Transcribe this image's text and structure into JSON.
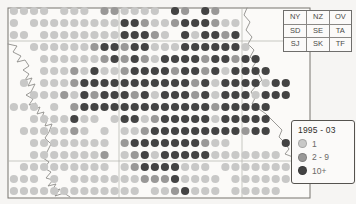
{
  "figure": {
    "type": "hectad dot distribution map",
    "region_squares_table": {
      "rows": [
        [
          "NY",
          "NZ",
          "OV"
        ],
        [
          "SD",
          "SE",
          "TA"
        ],
        [
          "SJ",
          "SK",
          "TF"
        ]
      ]
    },
    "legend": {
      "title": "1995 - 03",
      "items": [
        {
          "label": "1",
          "value": 1,
          "color": "#c8c8c7"
        },
        {
          "label": "2 - 9",
          "value": 2,
          "color": "#999897"
        },
        {
          "label": "10+",
          "value": 3,
          "color": "#434343"
        }
      ]
    }
  },
  "chart_data": {
    "type": "dot-distribution-map",
    "title": "1995 - 03",
    "legend_classes": [
      "1",
      "2 - 9",
      "10+"
    ],
    "cell_value_meaning": {
      "0": "no record",
      "1": "1",
      "2": "2 - 9",
      "3": "10+"
    },
    "map_frame": {
      "x": 8,
      "y": 8,
      "width": 302,
      "height": 190
    },
    "gridlines": {
      "vertical_x": [
        119,
        242
      ],
      "horizontal_y": [
        41,
        161
      ]
    },
    "grid": {
      "cols": 29,
      "rows": 16,
      "x0": 13.9,
      "dx": 10.07,
      "y0": 11,
      "dy": 12,
      "dot_radius": 4.1,
      "values": [
        [
          1,
          1,
          1,
          1,
          0,
          1,
          1,
          1,
          0,
          2,
          2,
          1,
          1,
          1,
          1,
          0,
          3,
          2,
          0,
          3,
          2,
          0,
          0,
          0,
          0,
          0,
          0,
          0,
          0
        ],
        [
          1,
          0,
          1,
          1,
          1,
          1,
          1,
          1,
          1,
          1,
          1,
          3,
          3,
          2,
          1,
          1,
          2,
          3,
          3,
          3,
          2,
          1,
          1,
          0,
          0,
          0,
          0,
          0,
          0
        ],
        [
          1,
          1,
          0,
          1,
          1,
          1,
          1,
          1,
          1,
          1,
          1,
          3,
          3,
          3,
          2,
          1,
          0,
          3,
          1,
          3,
          3,
          2,
          3,
          0,
          0,
          0,
          0,
          0,
          0
        ],
        [
          0,
          0,
          1,
          1,
          1,
          1,
          1,
          1,
          2,
          3,
          3,
          2,
          3,
          3,
          1,
          1,
          1,
          3,
          3,
          3,
          3,
          3,
          3,
          1,
          0,
          0,
          0,
          0,
          0
        ],
        [
          0,
          0,
          0,
          1,
          1,
          1,
          1,
          1,
          1,
          2,
          3,
          2,
          3,
          2,
          1,
          3,
          3,
          3,
          3,
          2,
          3,
          3,
          2,
          3,
          3,
          0,
          0,
          0,
          0
        ],
        [
          0,
          0,
          0,
          1,
          1,
          1,
          2,
          1,
          3,
          1,
          1,
          2,
          3,
          3,
          3,
          3,
          2,
          3,
          3,
          2,
          3,
          1,
          3,
          3,
          3,
          3,
          0,
          0,
          0
        ],
        [
          0,
          1,
          0,
          1,
          1,
          1,
          2,
          3,
          3,
          3,
          3,
          3,
          3,
          3,
          3,
          3,
          3,
          3,
          2,
          3,
          1,
          3,
          3,
          3,
          3,
          1,
          3,
          3,
          0
        ],
        [
          0,
          0,
          1,
          1,
          1,
          2,
          1,
          3,
          2,
          3,
          3,
          3,
          2,
          3,
          1,
          3,
          3,
          3,
          2,
          3,
          1,
          3,
          3,
          3,
          1,
          3,
          3,
          3,
          0
        ],
        [
          1,
          1,
          1,
          0,
          1,
          0,
          2,
          3,
          3,
          3,
          3,
          3,
          3,
          3,
          3,
          3,
          3,
          3,
          3,
          3,
          2,
          3,
          3,
          3,
          3,
          3,
          0,
          0,
          0
        ],
        [
          0,
          0,
          1,
          1,
          1,
          1,
          3,
          1,
          1,
          0,
          1,
          3,
          3,
          1,
          2,
          3,
          3,
          3,
          3,
          3,
          1,
          3,
          3,
          3,
          3,
          3,
          0,
          0,
          0
        ],
        [
          0,
          1,
          1,
          1,
          1,
          1,
          2,
          1,
          0,
          1,
          0,
          1,
          1,
          2,
          3,
          3,
          3,
          3,
          3,
          3,
          3,
          3,
          3,
          2,
          3,
          3,
          0,
          0,
          0
        ],
        [
          0,
          0,
          1,
          1,
          1,
          1,
          1,
          1,
          1,
          1,
          0,
          2,
          3,
          3,
          3,
          3,
          3,
          3,
          3,
          2,
          1,
          1,
          0,
          0,
          0,
          0,
          0,
          3,
          3
        ],
        [
          0,
          0,
          1,
          1,
          1,
          1,
          1,
          1,
          1,
          2,
          0,
          1,
          2,
          3,
          1,
          3,
          3,
          3,
          3,
          3,
          1,
          1,
          1,
          1,
          1,
          1,
          1,
          0,
          0
        ],
        [
          0,
          1,
          1,
          1,
          1,
          1,
          1,
          1,
          1,
          1,
          0,
          1,
          2,
          3,
          3,
          3,
          3,
          1,
          1,
          1,
          0,
          1,
          1,
          1,
          1,
          1,
          1,
          1,
          0
        ],
        [
          1,
          1,
          1,
          0,
          1,
          0,
          1,
          1,
          1,
          1,
          1,
          1,
          1,
          2,
          2,
          2,
          3,
          1,
          1,
          1,
          1,
          0,
          1,
          1,
          1,
          1,
          1,
          1,
          0
        ],
        [
          1,
          1,
          1,
          1,
          1,
          1,
          1,
          1,
          1,
          1,
          1,
          1,
          1,
          0,
          1,
          1,
          2,
          3,
          1,
          1,
          1,
          0,
          1,
          1,
          1,
          1,
          1,
          0,
          0
        ]
      ]
    },
    "coastline": {
      "west": [
        [
          8,
          44
        ],
        [
          17,
          46
        ],
        [
          13,
          52
        ],
        [
          21,
          56
        ],
        [
          17,
          62
        ],
        [
          25,
          60
        ],
        [
          29,
          66
        ],
        [
          23,
          70
        ],
        [
          29,
          74
        ],
        [
          25,
          80
        ],
        [
          32,
          78
        ],
        [
          28,
          86
        ],
        [
          35,
          84
        ],
        [
          31,
          92
        ],
        [
          26,
          95
        ],
        [
          33,
          99
        ],
        [
          29,
          105
        ],
        [
          36,
          103
        ],
        [
          33,
          110
        ],
        [
          40,
          107
        ],
        [
          37,
          114
        ],
        [
          44,
          112
        ],
        [
          41,
          120
        ],
        [
          48,
          118
        ],
        [
          45,
          126
        ],
        [
          52,
          124
        ],
        [
          49,
          132
        ],
        [
          45,
          138
        ],
        [
          51,
          144
        ],
        [
          47,
          152
        ],
        [
          43,
          158
        ],
        [
          49,
          162
        ],
        [
          44,
          168
        ],
        [
          51,
          172
        ],
        [
          46,
          178
        ],
        [
          53,
          180
        ],
        [
          48,
          186
        ],
        [
          56,
          184
        ],
        [
          51,
          192
        ],
        [
          60,
          189
        ],
        [
          55,
          196
        ],
        [
          64,
          193
        ],
        [
          70,
          197
        ]
      ],
      "east": [
        [
          247,
          8
        ],
        [
          244,
          15
        ],
        [
          250,
          22
        ],
        [
          246,
          30
        ],
        [
          252,
          37
        ],
        [
          248,
          44
        ],
        [
          254,
          50
        ],
        [
          250,
          57
        ],
        [
          256,
          62
        ],
        [
          252,
          68
        ],
        [
          258,
          73
        ],
        [
          262,
          80
        ],
        [
          256,
          86
        ],
        [
          251,
          92
        ],
        [
          255,
          98
        ],
        [
          252,
          104
        ],
        [
          259,
          109
        ],
        [
          266,
          114
        ],
        [
          271,
          119
        ],
        [
          276,
          124
        ],
        [
          282,
          130
        ],
        [
          279,
          137
        ],
        [
          285,
          143
        ],
        [
          289,
          149
        ],
        [
          285,
          154
        ],
        [
          293,
          157
        ],
        [
          299,
          160
        ],
        [
          304,
          164
        ],
        [
          310,
          169
        ]
      ]
    },
    "colors": {
      "1": "#c8c8c7",
      "2": "#999897",
      "3": "#434343",
      "coast": "#8f8d8a",
      "frame": "#77756f",
      "grid": "#b3b1ae",
      "map_fill": "#fbfaf8",
      "background": "#f6f5f3"
    }
  }
}
